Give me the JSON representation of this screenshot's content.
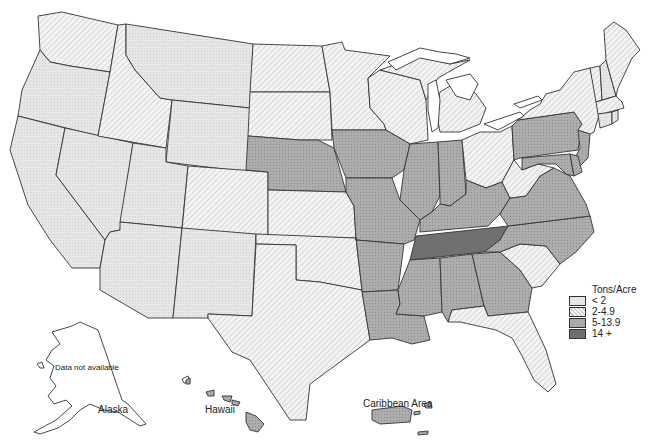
{
  "legend": {
    "title": "Tons/Acre",
    "classes": [
      {
        "id": "c1",
        "label": "< 2",
        "color": "#e4e4e4"
      },
      {
        "id": "c2",
        "label": "2-4.9",
        "color": "#f0f0f0"
      },
      {
        "id": "c3",
        "label": "5-13.9",
        "color": "#aaaaaa"
      },
      {
        "id": "c4",
        "label": "14 +",
        "color": "#6e6e6e"
      }
    ]
  },
  "labels": {
    "alaska": "Alaska",
    "alaska_note": "Data not available",
    "hawaii": "Hawaii",
    "caribbean": "Caribbean Area"
  },
  "states": {
    "lt2": [
      "Oregon",
      "California",
      "Nevada",
      "Utah",
      "Arizona",
      "New Mexico",
      "Montana",
      "Wyoming",
      "New Hampshire",
      "Connecticut",
      "Rhode Island"
    ],
    "2to4_9": [
      "Washington",
      "Idaho",
      "Colorado",
      "North Dakota",
      "South Dakota",
      "Kansas",
      "Oklahoma",
      "Texas",
      "Minnesota",
      "Wisconsin",
      "Michigan",
      "Ohio",
      "West Virginia",
      "New York",
      "Vermont",
      "Maine",
      "Massachusetts",
      "South Carolina",
      "Florida"
    ],
    "5to13_9": [
      "Nebraska",
      "Iowa",
      "Missouri",
      "Arkansas",
      "Louisiana",
      "Illinois",
      "Indiana",
      "Kentucky",
      "Mississippi",
      "Alabama",
      "Georgia",
      "Virginia",
      "North Carolina",
      "Pennsylvania",
      "New Jersey",
      "Maryland",
      "Delaware"
    ],
    "14plus": [
      "Tennessee",
      "Hawaii",
      "Caribbean Area"
    ],
    "no_data": [
      "Alaska"
    ]
  }
}
